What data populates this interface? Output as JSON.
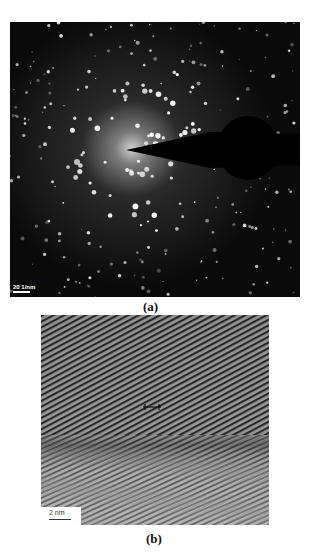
{
  "figure": {
    "panel_a": {
      "caption": "(a)",
      "description": "Selected area electron diffraction pattern with beam stop",
      "scale_bar": "20 1/nm"
    },
    "panel_b": {
      "caption": "(b)",
      "description": "HRTEM image showing lattice fringes",
      "scale_bar": "2 nm"
    }
  }
}
